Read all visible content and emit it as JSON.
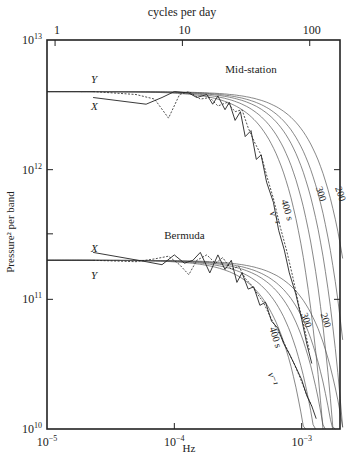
{
  "chart_data": {
    "type": "line",
    "title": "",
    "xlabel": "Hz",
    "ylabel": "Pressure² per band",
    "top_axis_label": "cycles per day",
    "xscale": "log",
    "yscale": "log",
    "xlim": [
      1e-05,
      0.002
    ],
    "ylim": [
      10000000000.0,
      10000000000000.0
    ],
    "grid": false,
    "x_ticks": [
      {
        "value": 1e-05,
        "base": "10",
        "exp": "−5"
      },
      {
        "value": 0.0001,
        "base": "10",
        "exp": "−4"
      },
      {
        "value": 0.001,
        "base": "10",
        "exp": "−3"
      }
    ],
    "top_ticks": [
      {
        "value": 1.157e-05,
        "label": "1"
      },
      {
        "value": 0.0001157,
        "label": "10"
      },
      {
        "value": 0.001157,
        "label": "100"
      }
    ],
    "y_ticks": [
      {
        "value": 10000000000.0,
        "base": "10",
        "exp": "10"
      },
      {
        "value": 100000000000.0,
        "base": "10",
        "exp": "11"
      },
      {
        "value": 1000000000000.0,
        "base": "10",
        "exp": "12"
      },
      {
        "value": 10000000000000.0,
        "base": "10",
        "exp": "13"
      }
    ],
    "panels": [
      {
        "name": "Mid-station",
        "plateau": 4000000000000.0,
        "label_pos": {
          "x": 0.0004,
          "y": 5600000000000.0
        },
        "x_label": {
          "text": "X",
          "x": 2.3e-05,
          "y": 3100000000000.0
        },
        "y_label": {
          "text": "Y",
          "x": 2.3e-05,
          "y": 5000000000000.0
        },
        "model_curves": [
          {
            "tau_s": 400,
            "label": "400 s",
            "fc": 0.0006
          },
          {
            "tau_s": 350,
            "label": "",
            "fc": 0.00072
          },
          {
            "tau_s": 300,
            "label": "300",
            "fc": 0.00086
          },
          {
            "tau_s": 250,
            "label": "",
            "fc": 0.001
          },
          {
            "tau_s": 200,
            "label": "200",
            "fc": 0.00122
          }
        ],
        "nu_label": {
          "text": "ν⁻¹",
          "x": 0.00058,
          "y": 420000000000.0
        },
        "series": [
          {
            "name": "X",
            "style": "solid",
            "x": [
              2.3e-05,
              6e-05,
              8e-05,
              0.0001,
              0.00013,
              0.00015,
              0.00018,
              0.0002,
              0.00022,
              0.00025,
              0.00027,
              0.0003,
              0.00033,
              0.00036,
              0.0004,
              0.00044,
              0.00048,
              0.00053,
              0.0006,
              0.00066,
              0.00073,
              0.0008,
              0.0009,
              0.001,
              0.0011,
              0.0012
            ],
            "y": [
              3600000000000.0,
              3200000000000.0,
              3600000000000.0,
              4000000000000.0,
              3900000000000.0,
              3600000000000.0,
              3800000000000.0,
              3200000000000.0,
              3700000000000.0,
              2900000000000.0,
              3300000000000.0,
              2400000000000.0,
              2800000000000.0,
              1800000000000.0,
              2000000000000.0,
              1200000000000.0,
              1300000000000.0,
              800000000000.0,
              560000000000.0,
              340000000000.0,
              240000000000.0,
              160000000000.0,
              110000000000.0,
              70000000000.0,
              45000000000.0,
              32000000000.0
            ]
          },
          {
            "name": "Y",
            "style": "dashed",
            "x": [
              2.3e-05,
              5e-05,
              7e-05,
              9e-05,
              0.00011,
              0.00013,
              0.00016,
              0.00019,
              0.00022,
              0.00026,
              0.0003,
              0.00034,
              0.00038,
              0.00043,
              0.00048,
              0.00054,
              0.0006,
              0.00068,
              0.00076,
              0.00085,
              0.00095,
              0.00105,
              0.00115
            ],
            "y": [
              4000000000000.0,
              3800000000000.0,
              3500000000000.0,
              2500000000000.0,
              3800000000000.0,
              4000000000000.0,
              3500000000000.0,
              3600000000000.0,
              3100000000000.0,
              3300000000000.0,
              2800000000000.0,
              2900000000000.0,
              2100000000000.0,
              1600000000000.0,
              1300000000000.0,
              850000000000.0,
              600000000000.0,
              360000000000.0,
              240000000000.0,
              150000000000.0,
              90000000000.0,
              60000000000.0,
              40000000000.0
            ]
          }
        ]
      },
      {
        "name": "Bermuda",
        "plateau": 200000000000.0,
        "label_pos": {
          "x": 0.00012,
          "y": 290000000000.0
        },
        "x_label": {
          "text": "X",
          "x": 2.3e-05,
          "y": 250000000000.0
        },
        "y_label": {
          "text": "Y",
          "x": 2.3e-05,
          "y": 155000000000.0
        },
        "model_curves": [
          {
            "tau_s": 400,
            "label": "400 s",
            "fc": 0.0006
          },
          {
            "tau_s": 350,
            "label": "",
            "fc": 0.00072
          },
          {
            "tau_s": 300,
            "label": "300",
            "fc": 0.00086
          },
          {
            "tau_s": 250,
            "label": "",
            "fc": 0.001
          },
          {
            "tau_s": 200,
            "label": "200",
            "fc": 0.00122
          }
        ],
        "nu_label": {
          "text": "ν⁻¹",
          "x": 0.00056,
          "y": 24000000000.0
        },
        "series": [
          {
            "name": "X",
            "style": "solid",
            "x": [
              2.3e-05,
              6e-05,
              8e-05,
              0.0001,
              0.00012,
              0.00014,
              0.00016,
              0.00019,
              0.00022,
              0.00025,
              0.00028,
              0.00031,
              0.00034,
              0.00038,
              0.00042,
              0.00047,
              0.00052,
              0.00058,
              0.00065,
              0.00072,
              0.0008,
              0.0009,
              0.001,
              0.0011,
              0.0012,
              0.0013
            ],
            "y": [
              230000000000.0,
              195000000000.0,
              185000000000.0,
              220000000000.0,
              190000000000.0,
              200000000000.0,
              230000000000.0,
              160000000000.0,
              220000000000.0,
              170000000000.0,
              200000000000.0,
              135000000000.0,
              160000000000.0,
              120000000000.0,
              125000000000.0,
              90000000000.0,
              95000000000.0,
              68000000000.0,
              60000000000.0,
              46000000000.0,
              38000000000.0,
              30000000000.0,
              24000000000.0,
              18000000000.0,
              15000000000.0,
              12000000000.0
            ]
          },
          {
            "name": "Y",
            "style": "dashed",
            "x": [
              2.3e-05,
              5e-05,
              7e-05,
              9e-05,
              0.00011,
              0.00013,
              0.00015,
              0.00018,
              0.00021,
              0.00024,
              0.00028,
              0.00032,
              0.00036,
              0.0004,
              0.00045,
              0.0005,
              0.00056,
              0.00063,
              0.0007,
              0.00078,
              0.00087,
              0.00097,
              0.00108,
              0.0012
            ],
            "y": [
              200000000000.0,
              195000000000.0,
              205000000000.0,
              215000000000.0,
              185000000000.0,
              155000000000.0,
              200000000000.0,
              220000000000.0,
              190000000000.0,
              210000000000.0,
              170000000000.0,
              180000000000.0,
              145000000000.0,
              130000000000.0,
              110000000000.0,
              95000000000.0,
              75000000000.0,
              60000000000.0,
              50000000000.0,
              40000000000.0,
              32000000000.0,
              25000000000.0,
              19000000000.0,
              15000000000.0
            ]
          }
        ]
      }
    ]
  },
  "frame": {
    "left": 47,
    "right": 340,
    "top": 40,
    "bottom": 429
  },
  "colors": {
    "axis": "#222222",
    "curve": "#555555",
    "data": "#222222"
  }
}
